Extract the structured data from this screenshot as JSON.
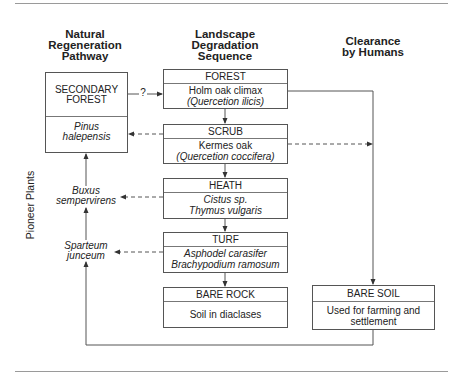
{
  "headers": {
    "natural": "Natural Regeneration Pathway",
    "natural_lines": [
      "Natural",
      "Regeneration",
      "Pathway"
    ],
    "degradation_lines": [
      "Landscape",
      "Degradation",
      "Sequence"
    ],
    "clearance_lines": [
      "Clearance",
      "by Humans"
    ]
  },
  "side_label": "Pioneer Plants",
  "secondary_forest": {
    "title_lines": [
      "SECONDARY",
      "FOREST"
    ],
    "species_lines": [
      "Pinus",
      "halepensis"
    ]
  },
  "question_mark": "?",
  "sequence": [
    {
      "title": "FOREST",
      "lines": [
        "Holm oak climax",
        "(Quercetion ilicis)"
      ],
      "italic": [
        false,
        true
      ]
    },
    {
      "title": "SCRUB",
      "lines": [
        "Kermes oak",
        "(Quercetion coccifera)"
      ],
      "italic": [
        false,
        true
      ]
    },
    {
      "title": "HEATH",
      "lines": [
        "Cistus sp.",
        "Thymus vulgaris"
      ],
      "italic": [
        true,
        true
      ]
    },
    {
      "title": "TURF",
      "lines": [
        "Asphodel carasifer",
        "Brachypodium ramosum"
      ],
      "italic": [
        true,
        true
      ]
    },
    {
      "title": "BARE ROCK",
      "lines": [
        "Soil in diaclases"
      ],
      "italic": [
        false
      ]
    }
  ],
  "pioneers": [
    {
      "lines": [
        "Buxus",
        "sempervirens"
      ]
    },
    {
      "lines": [
        "Sparteum",
        "junceum"
      ]
    }
  ],
  "bare_soil": {
    "title": "BARE SOIL",
    "lines": [
      "Used for farming and",
      "settlement"
    ]
  }
}
